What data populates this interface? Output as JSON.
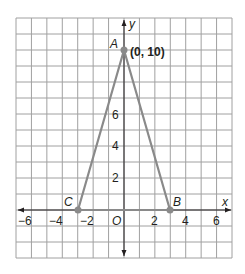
{
  "chart_data": {
    "type": "scatter",
    "title": "",
    "xlabel": "x",
    "ylabel": "y",
    "xlim": [
      -7,
      7
    ],
    "ylim": [
      -3,
      12
    ],
    "grid": true,
    "x_ticks": [
      "−6",
      "−4",
      "−2",
      "2",
      "4",
      "6"
    ],
    "y_ticks": [
      "2",
      "4",
      "6"
    ],
    "origin_label": "O",
    "points": [
      {
        "label": "A",
        "x": 0,
        "y": 10,
        "annotation": "(0, 10)"
      },
      {
        "label": "B",
        "x": 3,
        "y": 0
      },
      {
        "label": "C",
        "x": -3,
        "y": 0
      }
    ],
    "polygon": [
      "A",
      "B",
      "C"
    ],
    "colors": {
      "triangle": "#8a8a8a",
      "grid": "#a0a0a0",
      "axes": "#231f20"
    }
  }
}
